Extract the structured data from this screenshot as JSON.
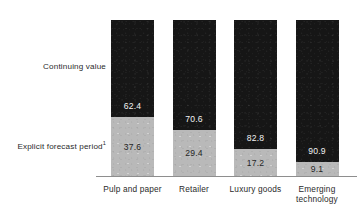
{
  "chart_data": {
    "type": "bar",
    "subtype": "stacked-100-percent",
    "title": "",
    "subtitle": "",
    "xlabel": "",
    "ylabel": "",
    "ylim": [
      0,
      100
    ],
    "grid": false,
    "legend_position": "left-inline-labels",
    "orientation": "vertical",
    "categories": [
      "Pulp and paper",
      "Retailer",
      "Luxury goods",
      "Emerging technology"
    ],
    "category_lines": [
      [
        "Pulp and paper"
      ],
      [
        "Retailer"
      ],
      [
        "Luxury goods"
      ],
      [
        "Emerging",
        "technology"
      ]
    ],
    "series": [
      {
        "name": "Continuing value",
        "color": "#161616",
        "value_color": "#f2f2f2",
        "values": [
          62.4,
          70.6,
          82.8,
          90.9
        ],
        "labels": [
          "62.4",
          "70.6",
          "82.8",
          "90.9"
        ]
      },
      {
        "name": "Explicit forecast period",
        "name_footnote": "1",
        "color": "#b9b9b9",
        "value_color": "#262626",
        "values": [
          37.6,
          29.4,
          17.2,
          9.1
        ],
        "labels": [
          "37.6",
          "29.4",
          "17.2",
          "9.1"
        ]
      }
    ],
    "stack_order": [
      "Explicit forecast period",
      "Continuing value"
    ],
    "axis_line_color": "#8e8e8e"
  },
  "labels": {
    "continuing_value": "Continuing value",
    "explicit_forecast": "Explicit forecast period",
    "explicit_forecast_footnote": "1"
  }
}
